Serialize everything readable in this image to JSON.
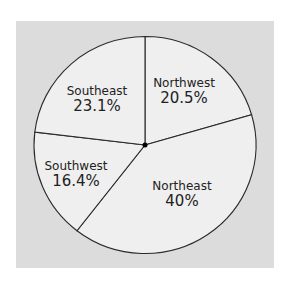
{
  "chart_data": {
    "type": "pie",
    "title": "",
    "categories": [
      "Northwest",
      "Northeast",
      "Southwest",
      "Southeast"
    ],
    "values": [
      20.5,
      40,
      16.4,
      23.1
    ],
    "labels": [
      "20.5%",
      "40%",
      "16.4%",
      "23.1%"
    ],
    "start_angle_deg": 0,
    "direction": "clockwise",
    "legend": "none",
    "slice_labels_inside": true
  },
  "colors": {
    "page_background": "#ffffff",
    "panel_background": "#dcdcdc",
    "slice_fill": "#efefef",
    "slice_stroke": "#2a2a2a",
    "text": "#222222"
  },
  "slices": [
    {
      "name": "Northwest",
      "pct_label": "20.5%"
    },
    {
      "name": "Northeast",
      "pct_label": "40%"
    },
    {
      "name": "Southwest",
      "pct_label": "16.4%"
    },
    {
      "name": "Southeast",
      "pct_label": "23.1%"
    }
  ]
}
